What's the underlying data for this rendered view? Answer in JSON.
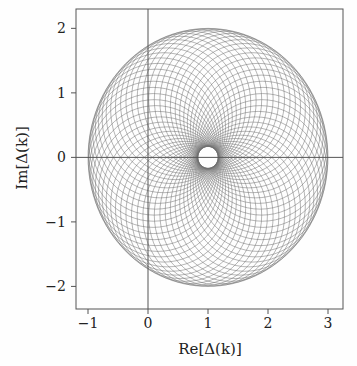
{
  "chart_data": {
    "type": "line",
    "title": "",
    "xlabel": "Re[Δ(k)]",
    "ylabel": "Im[Δ(k)]",
    "xlim": [
      -1.2,
      3.25
    ],
    "ylim": [
      -2.35,
      2.3
    ],
    "x_ticks": [
      -1,
      0,
      1,
      2,
      3
    ],
    "y_ticks": [
      2,
      1,
      0,
      -1,
      -2
    ],
    "x_tick_labels": [
      "−1",
      "0",
      "1",
      "2",
      "3"
    ],
    "y_tick_labels": [
      "2",
      "1",
      "0",
      "−1",
      "−2"
    ],
    "grid": false,
    "legend": null,
    "reference_lines": [
      {
        "axis": "x",
        "value": 0
      },
      {
        "axis": "y",
        "value": 0
      }
    ],
    "series": [
      {
        "name": "circle family",
        "pattern_center": [
          1,
          0
        ],
        "circle_radius": 1.085,
        "center_orbit_radius": 0.915,
        "num_circles": 60,
        "outer_envelope": {
          "center": [
            1,
            0
          ],
          "radius": 2.0
        },
        "inner_envelope": {
          "center": [
            1,
            0
          ],
          "radius": 0.17
        },
        "color": "#6e6e6e"
      }
    ]
  },
  "colors": {
    "axis": "#555555",
    "curve": "#6e6e6e",
    "background": "#fefefe"
  }
}
